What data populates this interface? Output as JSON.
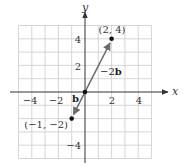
{
  "diagram": {
    "type": "coordinate-plane-vectors",
    "x_axis": {
      "label": "x",
      "range": [
        -5,
        5
      ],
      "tick_labels": [
        "−4",
        "−2",
        "2",
        "4"
      ],
      "tick_values": [
        -4,
        -2,
        2,
        4
      ]
    },
    "y_axis": {
      "label": "y",
      "range": [
        -5,
        5
      ],
      "tick_labels": [
        "4",
        "2",
        "−4"
      ],
      "tick_values": [
        4,
        2,
        -4
      ]
    },
    "grid": {
      "step": 1,
      "color": "#cccccc"
    },
    "points": [
      {
        "label": "(2, 4)",
        "x": 2,
        "y": 4
      },
      {
        "label": "(−1, −2)",
        "x": -1,
        "y": -2
      },
      {
        "label": "",
        "x": 0,
        "y": 0
      }
    ],
    "vectors": [
      {
        "name": "b",
        "from": [
          0,
          0
        ],
        "to": [
          -1,
          -2
        ],
        "label_prefix": "",
        "label_bold": "b"
      },
      {
        "name": "-2b",
        "from": [
          0,
          0
        ],
        "to": [
          2,
          4
        ],
        "label_prefix": "−2",
        "label_bold": "b"
      }
    ],
    "colors": {
      "axes": "#333333",
      "vectors": "#6b6b6b",
      "points": "#111111",
      "grid": "#cccccc"
    }
  }
}
